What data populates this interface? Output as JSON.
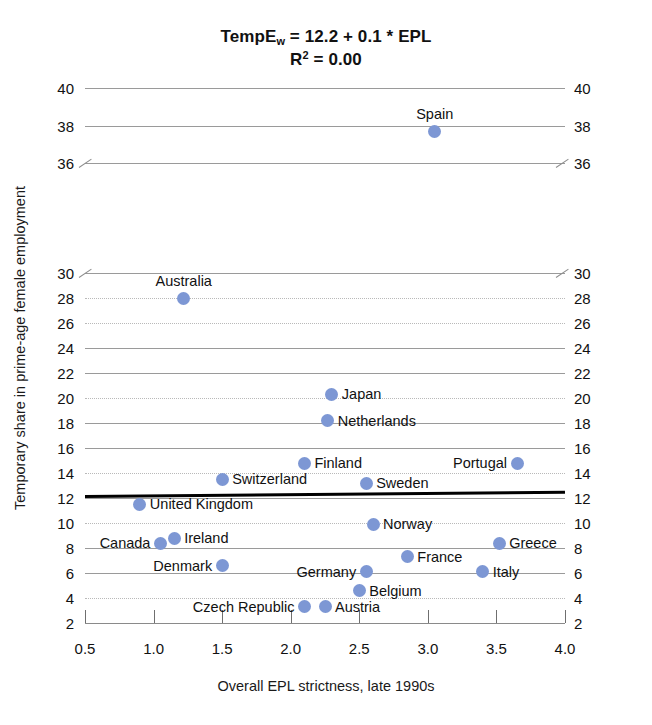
{
  "chart_data": {
    "type": "scatter",
    "title_main": "TempE",
    "title_sub": "w",
    "title_rest": " = 12.2 + 0.1 * EPL",
    "subtitle_main": "R",
    "subtitle_sup": "2",
    "subtitle_rest": " = 0.00",
    "r_squared": 0.0,
    "regression": {
      "intercept": 12.2,
      "slope": 0.1
    },
    "xlabel": "Overall EPL strictness, late 1990s",
    "ylabel": "Temporary share in prime-age female employment",
    "xlim": [
      0.5,
      4.0
    ],
    "ylim": [
      2,
      40
    ],
    "axis_break": {
      "from": 30,
      "to": 36
    },
    "grid": true,
    "legend": "none",
    "dot_color": "#7d97d4",
    "regression_color": "#000000",
    "grid_color": "#9a9a9a",
    "xticks": [
      "0.5",
      "1.0",
      "1.5",
      "2.0",
      "2.5",
      "3.0",
      "3.5",
      "4.0"
    ],
    "xtick_values": [
      0.5,
      1.0,
      1.5,
      2.0,
      2.5,
      3.0,
      3.5,
      4.0
    ],
    "yticks": [
      "2",
      "4",
      "6",
      "8",
      "10",
      "12",
      "14",
      "16",
      "18",
      "20",
      "22",
      "24",
      "26",
      "28",
      "30",
      "36",
      "38",
      "40"
    ],
    "ytick_values": [
      2,
      4,
      6,
      8,
      10,
      12,
      14,
      16,
      18,
      20,
      22,
      24,
      26,
      28,
      30,
      36,
      38,
      40
    ],
    "points": [
      {
        "label": "Spain",
        "x": 3.05,
        "y": 37.7,
        "pos": "lbl-above"
      },
      {
        "label": "Australia",
        "x": 1.22,
        "y": 28.0,
        "pos": "lbl-above"
      },
      {
        "label": "Japan",
        "x": 2.3,
        "y": 20.3,
        "pos": "lbl-right"
      },
      {
        "label": "Netherlands",
        "x": 2.27,
        "y": 18.2,
        "pos": "lbl-right"
      },
      {
        "label": "Finland",
        "x": 2.1,
        "y": 14.8,
        "pos": "lbl-right"
      },
      {
        "label": "Portugal",
        "x": 3.65,
        "y": 14.8,
        "pos": "lbl-left"
      },
      {
        "label": "Switzerland",
        "x": 1.5,
        "y": 13.5,
        "pos": "lbl-right"
      },
      {
        "label": "Sweden",
        "x": 2.55,
        "y": 13.2,
        "pos": "lbl-right"
      },
      {
        "label": "United Kingdom",
        "x": 0.9,
        "y": 11.5,
        "pos": "lbl-right"
      },
      {
        "label": "Norway",
        "x": 2.6,
        "y": 9.9,
        "pos": "lbl-right"
      },
      {
        "label": "Ireland",
        "x": 1.15,
        "y": 8.8,
        "pos": "lbl-right"
      },
      {
        "label": "Canada",
        "x": 1.05,
        "y": 8.4,
        "pos": "lbl-left"
      },
      {
        "label": "Greece",
        "x": 3.52,
        "y": 8.4,
        "pos": "lbl-right"
      },
      {
        "label": "France",
        "x": 2.85,
        "y": 7.3,
        "pos": "lbl-right"
      },
      {
        "label": "Denmark",
        "x": 1.5,
        "y": 6.6,
        "pos": "lbl-left"
      },
      {
        "label": "Germany",
        "x": 2.55,
        "y": 6.1,
        "pos": "lbl-left"
      },
      {
        "label": "Italy",
        "x": 3.4,
        "y": 6.1,
        "pos": "lbl-right"
      },
      {
        "label": "Belgium",
        "x": 2.5,
        "y": 4.6,
        "pos": "lbl-right"
      },
      {
        "label": "Czech Republic",
        "x": 2.1,
        "y": 3.3,
        "pos": "lbl-left"
      },
      {
        "label": "Austria",
        "x": 2.25,
        "y": 3.3,
        "pos": "lbl-right"
      }
    ]
  }
}
